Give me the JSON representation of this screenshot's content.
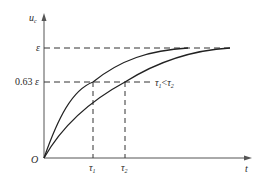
{
  "diagram": {
    "y_axis": {
      "label": "u",
      "label_sub": "c"
    },
    "x_axis": {
      "label": "t"
    },
    "origin_label": "O",
    "levels": {
      "epsilon": {
        "label": "ε"
      },
      "sixty_three": {
        "label_num": "0.63",
        "label_sym": "ε"
      }
    },
    "time_constants": [
      {
        "label": "τ",
        "sub": "1"
      },
      {
        "label": "τ",
        "sub": "2"
      }
    ],
    "annotation": {
      "a": "τ",
      "a_sub": "1",
      "op": "<",
      "b": "τ",
      "b_sub": "2"
    },
    "curves": [
      {
        "name": "curve-tau1",
        "description": "faster rise, time constant τ1"
      },
      {
        "name": "curve-tau2",
        "description": "slower rise, time constant τ2"
      }
    ],
    "colors": {
      "line": "#2a2a2a",
      "axis": "#555555"
    }
  }
}
